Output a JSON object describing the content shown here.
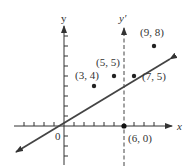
{
  "axes": {
    "x_label": "x",
    "y_label": "y",
    "y_prime_label": "y′",
    "origin_label": "0"
  },
  "points": [
    {
      "label": "(3, 4)",
      "x": 3,
      "y": 4
    },
    {
      "label": "(5, 5)",
      "x": 5,
      "y": 5
    },
    {
      "label": "(7, 5)",
      "x": 7,
      "y": 5
    },
    {
      "label": "(9, 8)",
      "x": 9,
      "y": 8
    },
    {
      "label": "(6, 0)",
      "x": 6,
      "y": 0
    }
  ],
  "colors": {
    "ink": "#333333",
    "line": "#444444"
  }
}
